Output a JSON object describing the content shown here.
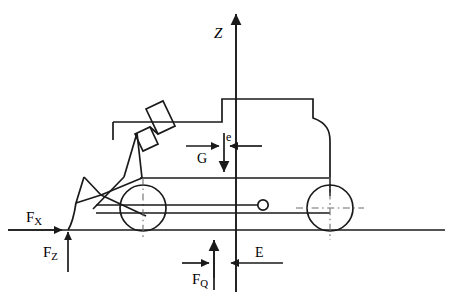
{
  "diagram": {
    "type": "free-body-diagram",
    "stroke_color": "#1a1a1a",
    "background_color": "#ffffff",
    "labels": {
      "axis_z": "Z",
      "force_fx_main": "F",
      "force_fx_sub": "X",
      "force_fz_main": "F",
      "force_fz_sub": "Z",
      "force_fq_main": "F",
      "force_fq_sub": "Q",
      "force_g": "G",
      "dim_e_small": "e",
      "dim_e_big": "E"
    },
    "elements": {
      "ground_line": "ground-line",
      "z_axis": "vertical-z-axis",
      "front_wheel": "front-wheel",
      "rear_wheel": "rear-wheel",
      "bucket": "loader-bucket",
      "lift_arm": "lift-arm",
      "hydraulic_cylinder": "hydraulic-cylinder",
      "body": "machine-body-outline",
      "hitch_pin": "hitch-pin-circle"
    },
    "forces": [
      {
        "name": "F_X",
        "direction": "right",
        "point": "bucket-ground-contact"
      },
      {
        "name": "F_Z",
        "direction": "up",
        "point": "bucket-ground-contact"
      },
      {
        "name": "F_Q",
        "direction": "up",
        "point": "front-axle-vertical"
      },
      {
        "name": "G",
        "direction": "down",
        "point": "center-of-gravity"
      }
    ],
    "dimensions": [
      {
        "name": "e",
        "from": "center-of-gravity",
        "to": "z-axis"
      },
      {
        "name": "E",
        "from": "F_Q-line",
        "to": "z-axis"
      }
    ]
  }
}
